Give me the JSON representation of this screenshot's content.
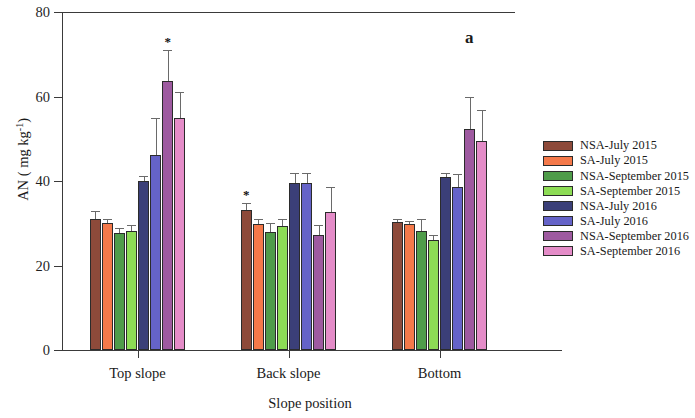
{
  "figure": {
    "panel_label": "a"
  },
  "chart_data": {
    "type": "bar",
    "title": "",
    "xlabel": "Slope position",
    "ylabel": "AN ( mg kg-1)",
    "ylabel_parts": {
      "main": "AN ( mg kg",
      "sup": "-1",
      "tail": ")"
    },
    "categories": [
      "Top slope",
      "Back slope",
      "Bottom"
    ],
    "ylim": [
      0,
      80
    ],
    "yticks": [
      0,
      20,
      40,
      60,
      80
    ],
    "ytick_labels": [
      "0",
      "20",
      "40",
      "60",
      "80"
    ],
    "grid": false,
    "legend_position": "right",
    "error_bars": "standard deviation",
    "significance_marker": "*",
    "series": [
      {
        "name": "NSA-July 2015",
        "color": "#8d4a3a",
        "values": [
          31.0,
          33.2,
          30.4
        ],
        "errors": [
          2.0,
          1.6,
          0.6
        ],
        "significant": [
          false,
          true,
          false
        ]
      },
      {
        "name": "SA-July 2015",
        "color": "#f4794a",
        "values": [
          30.1,
          29.8,
          29.9
        ],
        "errors": [
          1.0,
          1.2,
          0.6
        ],
        "significant": [
          false,
          false,
          false
        ]
      },
      {
        "name": "NSA-September 2015",
        "color": "#4f9c4a",
        "values": [
          27.6,
          28.0,
          28.2
        ],
        "errors": [
          1.3,
          2.1,
          2.9
        ],
        "significant": [
          false,
          false,
          false
        ]
      },
      {
        "name": "SA-September 2015",
        "color": "#8ddc55",
        "values": [
          28.1,
          29.4,
          26.1
        ],
        "errors": [
          1.5,
          1.5,
          1.2
        ],
        "significant": [
          false,
          false,
          false
        ]
      },
      {
        "name": "NSA-July 2016",
        "color": "#3b3f78",
        "values": [
          40.1,
          39.6,
          41.0
        ],
        "errors": [
          1.0,
          2.2,
          1.0
        ],
        "significant": [
          false,
          false,
          false
        ]
      },
      {
        "name": "SA-July 2016",
        "color": "#6563c8",
        "values": [
          46.2,
          39.5,
          38.6
        ],
        "errors": [
          8.7,
          2.3,
          3.1
        ],
        "significant": [
          false,
          false,
          false
        ]
      },
      {
        "name": "NSA-September 2016",
        "color": "#9e5aa0",
        "values": [
          63.6,
          27.2,
          52.2
        ],
        "errors": [
          7.5,
          2.4,
          7.7
        ],
        "significant": [
          true,
          false,
          false
        ]
      },
      {
        "name": "SA-September 2016",
        "color": "#e48cc8",
        "values": [
          54.9,
          32.6,
          49.5
        ],
        "errors": [
          6.2,
          6.0,
          7.3
        ],
        "significant": [
          false,
          false,
          false
        ]
      }
    ]
  }
}
